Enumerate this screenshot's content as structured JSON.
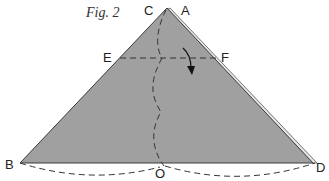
{
  "figure": {
    "caption": "Fig. 2",
    "fill_color": "#a0a0a0",
    "edge_color": "#3a3a3a",
    "points": {
      "A": {
        "label": "A"
      },
      "B": {
        "label": "B"
      },
      "C": {
        "label": "C"
      },
      "D": {
        "label": "D"
      },
      "E": {
        "label": "E"
      },
      "F": {
        "label": "F"
      },
      "O": {
        "label": "O"
      }
    },
    "elements": [
      "triangle CBD (folded paper)",
      "dashed fold line EF",
      "wavy dashed line C to O",
      "dashed arcs below base B-O and O-D",
      "curved arrow indicating fold down"
    ]
  }
}
